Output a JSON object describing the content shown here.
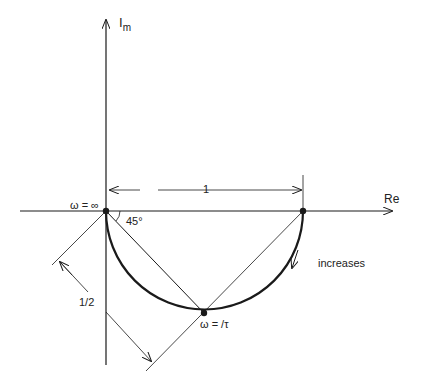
{
  "diagram": {
    "axes": {
      "real_label": "Re",
      "imag_label": "I",
      "imag_sub": "m"
    },
    "labels": {
      "omega_inf": "ω = ∞",
      "omega_tau": "ω = /τ",
      "angle": "45°",
      "dim_one": "1",
      "dim_half": "1/2",
      "increases": "increases"
    },
    "colors": {
      "ink": "#1a1a1a",
      "background": "#ffffff"
    }
  }
}
